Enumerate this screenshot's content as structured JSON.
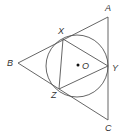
{
  "diagram": {
    "type": "geometry",
    "labels": {
      "A": "A",
      "B": "B",
      "C": "C",
      "X": "X",
      "Y": "Y",
      "Z": "Z",
      "O": "O"
    },
    "points": {
      "A": [
        108,
        17
      ],
      "B": [
        18,
        63
      ],
      "C": [
        108,
        120
      ],
      "X": [
        63,
        39
      ],
      "Y": [
        108,
        66
      ],
      "Z": [
        59,
        89
      ],
      "O": [
        78,
        65
      ]
    },
    "circle": {
      "cx": 77,
      "cy": 66,
      "r": 31
    },
    "outer_triangle": [
      "A",
      "B",
      "C"
    ],
    "inner_triangle": [
      "X",
      "Y",
      "Z"
    ],
    "stroke_color": "#555555"
  }
}
